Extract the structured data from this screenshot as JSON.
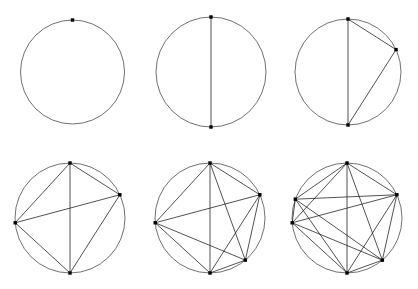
{
  "figure": {
    "background_color": "#ffffff",
    "circle_stroke_color": "#4d4d4d",
    "chord_stroke_color": "#1a1a1a",
    "vertex_color": "#000000",
    "width": 418,
    "height": 289
  },
  "chart_data": {
    "type": "diagram",
    "xlabel": "",
    "ylabel": "",
    "grid": false,
    "legend": "none",
    "layout": {
      "rows": 2,
      "columns": 3,
      "order": "left-to-right, top-to-bottom"
    },
    "vertex_angles_degrees": [
      90,
      25,
      -50,
      270,
      185,
      160
    ],
    "panels": [
      {
        "index": 1,
        "label": "1 point",
        "n_points": 1,
        "n_chords": 0,
        "n_regions": 1,
        "center": [
          72.5,
          72
        ],
        "radius": 52,
        "point_angles_degrees": [
          90
        ],
        "chords": []
      },
      {
        "index": 2,
        "label": "2 points",
        "n_points": 2,
        "n_chords": 1,
        "n_regions": 2,
        "center": [
          211,
          72
        ],
        "radius": 55,
        "point_angles_degrees": [
          90,
          270
        ],
        "chords": [
          [
            0,
            1
          ]
        ]
      },
      {
        "index": 3,
        "label": "3 points",
        "n_points": 3,
        "n_chords": 3,
        "n_regions": 4,
        "center": [
          348,
          72
        ],
        "radius": 53,
        "point_angles_degrees": [
          90,
          25,
          270
        ],
        "chords": [
          [
            0,
            1
          ],
          [
            0,
            2
          ],
          [
            1,
            2
          ]
        ]
      },
      {
        "index": 4,
        "label": "4 points",
        "n_points": 4,
        "n_chords": 6,
        "n_regions": 8,
        "center": [
          70,
          218
        ],
        "radius": 55,
        "point_angles_degrees": [
          90,
          25,
          270,
          185
        ],
        "chords": [
          [
            0,
            1
          ],
          [
            0,
            2
          ],
          [
            0,
            3
          ],
          [
            1,
            2
          ],
          [
            1,
            3
          ],
          [
            2,
            3
          ]
        ]
      },
      {
        "index": 5,
        "label": "5 points",
        "n_points": 5,
        "n_chords": 10,
        "n_regions": 16,
        "center": [
          210,
          218
        ],
        "radius": 55,
        "point_angles_degrees": [
          90,
          25,
          -50,
          270,
          185
        ],
        "chords": [
          [
            0,
            1
          ],
          [
            0,
            2
          ],
          [
            0,
            3
          ],
          [
            0,
            4
          ],
          [
            1,
            2
          ],
          [
            1,
            3
          ],
          [
            1,
            4
          ],
          [
            2,
            3
          ],
          [
            2,
            4
          ],
          [
            3,
            4
          ]
        ]
      },
      {
        "index": 6,
        "label": "6 points",
        "n_points": 6,
        "n_chords": 15,
        "n_regions": 30,
        "center": [
          347,
          218
        ],
        "radius": 55,
        "point_angles_degrees": [
          90,
          25,
          -50,
          270,
          185,
          160
        ],
        "chords": [
          [
            0,
            1
          ],
          [
            0,
            2
          ],
          [
            0,
            3
          ],
          [
            0,
            4
          ],
          [
            0,
            5
          ],
          [
            1,
            2
          ],
          [
            1,
            3
          ],
          [
            1,
            4
          ],
          [
            1,
            5
          ],
          [
            2,
            3
          ],
          [
            2,
            4
          ],
          [
            2,
            5
          ],
          [
            3,
            4
          ],
          [
            3,
            5
          ],
          [
            4,
            5
          ]
        ]
      }
    ]
  }
}
